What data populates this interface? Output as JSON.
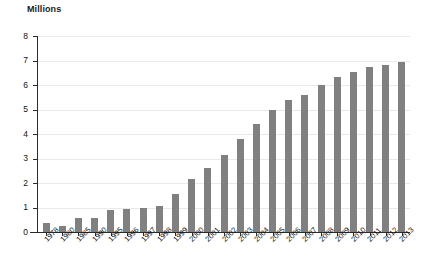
{
  "chart_data": {
    "type": "bar",
    "title": "Millions",
    "xlabel": "",
    "ylabel": "Millions",
    "ylim": [
      0,
      8
    ],
    "ytick_labels": [
      "0",
      "1",
      "2",
      "3",
      "4",
      "5",
      "6",
      "7",
      "8"
    ],
    "yticks": [
      0,
      1,
      2,
      3,
      4,
      5,
      6,
      7,
      8
    ],
    "grid": true,
    "legend": "none",
    "bar_color": "#808080",
    "categories": [
      "1978",
      "1980",
      "1985",
      "1990",
      "1995",
      "1996",
      "1997",
      "1998",
      "1999",
      "2000",
      "2001",
      "2002",
      "2003",
      "2004",
      "2005",
      "2006",
      "2007",
      "2008",
      "2009",
      "2010",
      "2011",
      "2012",
      "2013"
    ],
    "values": [
      0.35,
      0.25,
      0.58,
      0.57,
      0.88,
      0.92,
      0.96,
      1.05,
      1.55,
      2.15,
      2.62,
      3.15,
      3.78,
      4.42,
      4.98,
      5.4,
      5.58,
      6.02,
      6.32,
      6.55,
      6.75,
      6.82,
      6.95
    ]
  }
}
